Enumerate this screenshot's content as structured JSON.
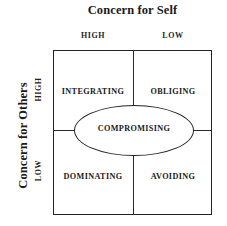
{
  "figure": {
    "title": "Concern for Self",
    "y_axis_title": "Concern for Others",
    "column_headers": [
      "HIGH",
      "LOW"
    ],
    "row_headers": [
      "HIGH",
      "LOW"
    ],
    "center_label": "COMPROMISING",
    "quadrants": [
      {
        "key": "integrating",
        "label": "INTEGRATING",
        "row": "HIGH",
        "col": "HIGH"
      },
      {
        "key": "obliging",
        "label": "OBLIGING",
        "row": "HIGH",
        "col": "LOW"
      },
      {
        "key": "dominating",
        "label": "DOMINATING",
        "row": "LOW",
        "col": "HIGH"
      },
      {
        "key": "avoiding",
        "label": "AVOIDING",
        "row": "LOW",
        "col": "LOW"
      }
    ]
  },
  "chart_data": {
    "type": "table",
    "title": "Concern for Self",
    "xlabel": "Concern for Self",
    "ylabel": "Concern for Others",
    "grid": true,
    "columns": [
      "HIGH",
      "LOW"
    ],
    "rows": [
      "HIGH",
      "LOW"
    ],
    "cells": [
      [
        "INTEGRATING",
        "OBLIGING"
      ],
      [
        "DOMINATING",
        "AVOIDING"
      ]
    ],
    "annotations": [
      "COMPROMISING"
    ],
    "legend": null
  },
  "colors": {
    "background": "#ffffff",
    "ink": "#1a1a1a",
    "rule": "#232323"
  }
}
